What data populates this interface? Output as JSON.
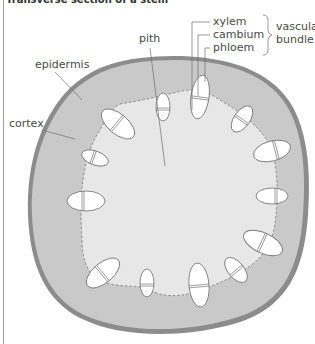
{
  "title": "Transverse section of a stem",
  "colors": {
    "epidermis": "#8c8c8c",
    "cortex": "#c9c9c9",
    "pith": "#e7e7e7",
    "bundle_fill": "#ffffff",
    "bundle_stroke": "#7a7a7a",
    "leader_line": "#6e6e6e",
    "label_text": "#4a4a4a"
  },
  "labels": {
    "pith": "pith",
    "epidermis": "epidermis",
    "cortex": "cortex",
    "xylem": "xylem",
    "cambium": "cambium",
    "phloem": "phloem",
    "group_line1": "vascular",
    "group_line2": "bundle"
  },
  "bundles": [
    {
      "cx": 163,
      "cy": 107,
      "rx": 7,
      "ry": 14,
      "rot": 0
    },
    {
      "cx": 200,
      "cy": 97,
      "rx": 9,
      "ry": 22,
      "rot": 8
    },
    {
      "cx": 242,
      "cy": 119,
      "rx": 8,
      "ry": 15,
      "rot": 35
    },
    {
      "cx": 272,
      "cy": 151,
      "rx": 19,
      "ry": 10,
      "rot": -15
    },
    {
      "cx": 272,
      "cy": 196,
      "rx": 16,
      "ry": 8,
      "rot": 0
    },
    {
      "cx": 263,
      "cy": 243,
      "rx": 21,
      "ry": 10,
      "rot": 25
    },
    {
      "cx": 236,
      "cy": 270,
      "rx": 8,
      "ry": 15,
      "rot": -40
    },
    {
      "cx": 199,
      "cy": 285,
      "rx": 10,
      "ry": 22,
      "rot": -5
    },
    {
      "cx": 147,
      "cy": 283,
      "rx": 7,
      "ry": 14,
      "rot": 0
    },
    {
      "cx": 103,
      "cy": 273,
      "rx": 10,
      "ry": 20,
      "rot": 50
    },
    {
      "cx": 86,
      "cy": 201,
      "rx": 19,
      "ry": 10,
      "rot": 0
    },
    {
      "cx": 95,
      "cy": 158,
      "rx": 14,
      "ry": 7,
      "rot": 20
    },
    {
      "cx": 118,
      "cy": 124,
      "rx": 20,
      "ry": 10,
      "rot": 40
    }
  ]
}
